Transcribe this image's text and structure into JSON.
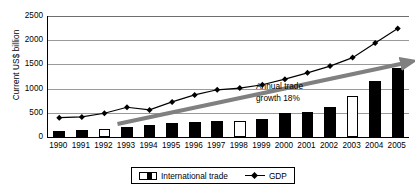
{
  "chart_data": {
    "type": "bar",
    "title": "",
    "subtitle": "",
    "xlabel": "",
    "ylabel": "Current US$ billion",
    "ylim": [
      0,
      2500
    ],
    "ytick_step": 500,
    "yticks": [
      2500,
      2000,
      1500,
      1000,
      500,
      0
    ],
    "grid": true,
    "legend_position": "bottom-center",
    "categories": [
      "1990",
      "1991",
      "1992",
      "1993",
      "1994",
      "1995",
      "1996",
      "1997",
      "1998",
      "1999",
      "2000",
      "2001",
      "2002",
      "2003",
      "2004",
      "2005"
    ],
    "series": [
      {
        "name": "International trade",
        "type": "bar",
        "color": "#000000",
        "values": [
          120,
          150,
          170,
          205,
          240,
          290,
          305,
          330,
          330,
          375,
          490,
          520,
          630,
          855,
          1150,
          1420
        ],
        "hollow_bars": [
          "1992",
          "1998",
          "2003"
        ]
      },
      {
        "name": "GDP",
        "type": "line",
        "color": "#000000",
        "marker": "diamond",
        "values": [
          400,
          415,
          490,
          615,
          560,
          725,
          870,
          975,
          1010,
          1080,
          1195,
          1325,
          1465,
          1640,
          1940,
          2240
        ]
      }
    ],
    "annotations": [
      {
        "name": "trend-arrow",
        "text_line1": "Annual trade",
        "text_line2": "growth 18%",
        "color": "#808080",
        "from_category": "1993",
        "to_category": "2005",
        "from_value": 270,
        "to_value": 1520
      }
    ]
  },
  "axis": {
    "y_title": "Current US$ billion",
    "y_ticks": [
      "2500",
      "2000",
      "1500",
      "1000",
      "500",
      "0"
    ],
    "x_ticks": [
      "1990",
      "1991",
      "1992",
      "1993",
      "1994",
      "1995",
      "1996",
      "1997",
      "1998",
      "1999",
      "2000",
      "2001",
      "2002",
      "2003",
      "2004",
      "2005"
    ]
  },
  "annotation": {
    "line1": "Annual trade",
    "line2": "growth 18%"
  },
  "legend": {
    "items": [
      {
        "label": "International trade",
        "marker": "bar-swatch-icon"
      },
      {
        "label": "GDP",
        "marker": "line-diamond-icon"
      }
    ]
  }
}
